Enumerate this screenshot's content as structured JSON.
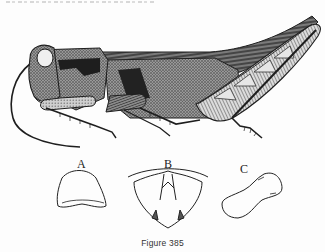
{
  "figure": {
    "caption": "Figure 385",
    "main_illustration": "grasshopper-side-view",
    "details": [
      {
        "label": "A",
        "subject": "pronotum-dorsal-outline"
      },
      {
        "label": "B",
        "subject": "head-frontal-outline"
      },
      {
        "label": "C",
        "subject": "segment-outline"
      }
    ]
  },
  "colors": {
    "ink": "#1e1e1e",
    "paper": "#fdfdfd",
    "shade": "#6a6a6a"
  }
}
